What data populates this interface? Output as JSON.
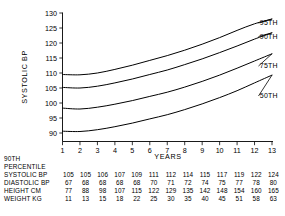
{
  "chart_data": {
    "type": "line",
    "title": "",
    "xlabel": "YEARS",
    "ylabel": "SYSTOLIC BP",
    "xlim": [
      1,
      13
    ],
    "ylim": [
      88,
      130
    ],
    "grid": false,
    "legend_position": "right-of-curves",
    "xticks": [
      "1",
      "2",
      "3",
      "4",
      "5",
      "6",
      "7",
      "8",
      "9",
      "10",
      "11",
      "12",
      "13"
    ],
    "yticks": [
      "90",
      "95",
      "100",
      "105",
      "110",
      "115",
      "120",
      "125",
      "130"
    ],
    "x": [
      1,
      2,
      3,
      4,
      5,
      6,
      7,
      8,
      9,
      10,
      11,
      12,
      13
    ],
    "series": [
      {
        "name": "95TH",
        "label": "95TH",
        "values": [
          109.5,
          109.4,
          110.0,
          111.2,
          112.6,
          114.2,
          115.8,
          117.6,
          119.6,
          121.8,
          124.2,
          126.4,
          128.0
        ]
      },
      {
        "name": "90TH",
        "label": "90TH",
        "values": [
          105.2,
          105.0,
          105.6,
          106.7,
          108.0,
          109.5,
          111.0,
          112.8,
          114.7,
          116.8,
          119.0,
          121.3,
          123.4
        ]
      },
      {
        "name": "75TH",
        "label": "75TH",
        "values": [
          98.3,
          98.0,
          98.6,
          99.6,
          100.8,
          102.2,
          103.6,
          105.3,
          107.2,
          109.3,
          111.6,
          114.0,
          116.4
        ]
      },
      {
        "name": "50TH",
        "label": "50TH",
        "values": [
          90.6,
          90.5,
          91.1,
          92.1,
          93.3,
          94.7,
          96.1,
          97.8,
          99.7,
          101.8,
          104.1,
          106.7,
          109.3
        ]
      }
    ]
  },
  "axis": {
    "y_title": "SYSTOLIC BP",
    "x_title": "YEARS"
  },
  "table": {
    "heading_line1": "90TH",
    "heading_line2": "PERCENTILE",
    "rows": [
      {
        "label": "SYSTOLIC BP",
        "values": [
          "105",
          "105",
          "106",
          "107",
          "109",
          "111",
          "112",
          "114",
          "115",
          "117",
          "119",
          "122",
          "124"
        ]
      },
      {
        "label": "DIASTOLIC BP",
        "values": [
          "67",
          "68",
          "68",
          "68",
          "68",
          "70",
          "71",
          "72",
          "74",
          "75",
          "77",
          "78",
          "80"
        ]
      },
      {
        "label": "HEIGHT CM",
        "values": [
          "77",
          "88",
          "98",
          "107",
          "115",
          "122",
          "129",
          "135",
          "142",
          "148",
          "154",
          "160",
          "165"
        ]
      },
      {
        "label": "WEIGHT KG",
        "values": [
          "11",
          "13",
          "15",
          "18",
          "22",
          "25",
          "30",
          "35",
          "40",
          "45",
          "51",
          "58",
          "63"
        ]
      }
    ]
  },
  "colors": {
    "line": "#000000",
    "text": "#000000",
    "background": "#ffffff"
  }
}
